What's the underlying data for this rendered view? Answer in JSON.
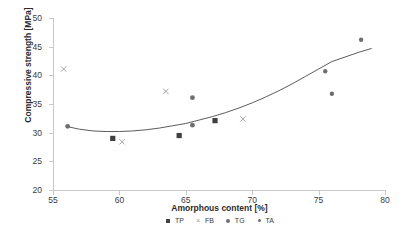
{
  "chart_data": {
    "type": "scatter",
    "title": "",
    "xlabel": "Amorphous content [%]",
    "ylabel": "Compressive strength [MPa]",
    "xlim": [
      55,
      80
    ],
    "ylim": [
      20,
      50
    ],
    "xticks": [
      55,
      60,
      65,
      70,
      75,
      80
    ],
    "yticks": [
      20,
      25,
      30,
      35,
      40,
      45,
      50
    ],
    "grid": false,
    "legend_position": "bottom",
    "series": [
      {
        "name": "TP",
        "marker": "square",
        "color": "#404040",
        "points": [
          {
            "x": 59.5,
            "y": 29.0
          },
          {
            "x": 64.5,
            "y": 29.5
          },
          {
            "x": 67.2,
            "y": 32.1
          }
        ]
      },
      {
        "name": "FB",
        "marker": "cross",
        "color": "#9a9a9a",
        "points": [
          {
            "x": 55.8,
            "y": 41.1
          },
          {
            "x": 60.2,
            "y": 28.4
          },
          {
            "x": 63.5,
            "y": 37.2
          },
          {
            "x": 69.3,
            "y": 32.4
          }
        ]
      },
      {
        "name": "TG",
        "marker": "dot",
        "color": "#6e6e6e",
        "points": [
          {
            "x": 56.1,
            "y": 31.1
          },
          {
            "x": 65.5,
            "y": 36.1
          },
          {
            "x": 65.5,
            "y": 31.3
          }
        ]
      },
      {
        "name": "TA",
        "marker": "dot-small",
        "color": "#6e6e6e",
        "points": [
          {
            "x": 75.5,
            "y": 40.7
          },
          {
            "x": 76.0,
            "y": 36.8
          },
          {
            "x": 78.2,
            "y": 46.2
          }
        ]
      }
    ],
    "trendline": {
      "name": "polynomial-fit",
      "color": "#4a4a4a",
      "points": [
        {
          "x": 56.0,
          "y": 31.1
        },
        {
          "x": 57.0,
          "y": 30.6
        },
        {
          "x": 58.0,
          "y": 30.3
        },
        {
          "x": 59.0,
          "y": 30.2
        },
        {
          "x": 60.0,
          "y": 30.2
        },
        {
          "x": 61.0,
          "y": 30.3
        },
        {
          "x": 62.0,
          "y": 30.5
        },
        {
          "x": 63.0,
          "y": 30.8
        },
        {
          "x": 64.0,
          "y": 31.2
        },
        {
          "x": 65.0,
          "y": 31.6
        },
        {
          "x": 66.0,
          "y": 32.2
        },
        {
          "x": 67.0,
          "y": 32.8
        },
        {
          "x": 68.0,
          "y": 33.5
        },
        {
          "x": 69.0,
          "y": 34.3
        },
        {
          "x": 70.0,
          "y": 35.2
        },
        {
          "x": 71.0,
          "y": 36.2
        },
        {
          "x": 72.0,
          "y": 37.3
        },
        {
          "x": 73.0,
          "y": 38.5
        },
        {
          "x": 74.0,
          "y": 39.8
        },
        {
          "x": 75.0,
          "y": 41.1
        },
        {
          "x": 76.0,
          "y": 42.4
        },
        {
          "x": 77.0,
          "y": 43.2
        },
        {
          "x": 78.0,
          "y": 44.0
        },
        {
          "x": 79.0,
          "y": 44.7
        }
      ]
    }
  },
  "legend": {
    "items": [
      {
        "label": "TP",
        "marker": "square"
      },
      {
        "label": "FB",
        "marker": "cross"
      },
      {
        "label": "TG",
        "marker": "dot"
      },
      {
        "label": "TA",
        "marker": "dot-small"
      }
    ]
  }
}
